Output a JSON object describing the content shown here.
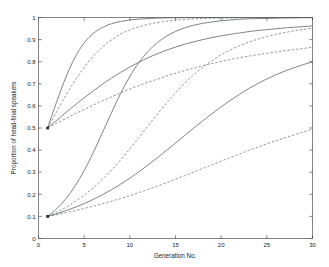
{
  "chart_data": {
    "type": "line",
    "title": "",
    "xlabel": "Generation No.",
    "ylabel": "Proportion of head-final speakers",
    "xlim": [
      0,
      30
    ],
    "ylim": [
      0,
      1
    ],
    "xticks": [
      0,
      5,
      10,
      15,
      20,
      25,
      30
    ],
    "xtick_labels": [
      "0",
      "5",
      "10",
      "15",
      "20",
      "25",
      "30"
    ],
    "yticks": [
      0,
      0.1,
      0.2,
      0.3,
      0.4,
      0.5,
      0.6,
      0.7,
      0.8,
      0.9,
      1
    ],
    "ytick_labels": [
      "0",
      "0.1",
      "0.2",
      "0.3",
      "0.4",
      "0.5",
      "0.6",
      "0.7",
      "0.8",
      "0.9",
      "1"
    ],
    "grid": false,
    "legend": null,
    "x": [
      1,
      2,
      3,
      4,
      5,
      6,
      7,
      8,
      9,
      10,
      11,
      12,
      13,
      14,
      15,
      16,
      17,
      18,
      19,
      20,
      21,
      22,
      23,
      24,
      25,
      26,
      27,
      28,
      29,
      30
    ],
    "series": [
      {
        "name": "start-0.5 fast solid",
        "style": "solid",
        "start": 0.5,
        "values": [
          0.5,
          0.62,
          0.73,
          0.82,
          0.885,
          0.928,
          0.955,
          0.972,
          0.982,
          0.989,
          0.993,
          0.9955,
          0.9972,
          0.9982,
          0.9989,
          0.9993,
          0.9996,
          0.9997,
          0.9998,
          0.9999,
          0.9999,
          1.0,
          1.0,
          1.0,
          1.0,
          1.0,
          1.0,
          1.0,
          1.0,
          1.0
        ]
      },
      {
        "name": "start-0.5 fast dashed",
        "style": "dashed",
        "start": 0.5,
        "values": [
          0.5,
          0.575,
          0.648,
          0.715,
          0.775,
          0.825,
          0.866,
          0.899,
          0.925,
          0.944,
          0.958,
          0.969,
          0.977,
          0.983,
          0.988,
          0.991,
          0.994,
          0.9955,
          0.9967,
          0.9976,
          0.9982,
          0.9987,
          0.999,
          0.9993,
          0.9995,
          0.9996,
          0.9997,
          0.9998,
          0.9998,
          0.9999
        ]
      },
      {
        "name": "start-0.5 medium solid",
        "style": "solid",
        "start": 0.5,
        "values": [
          0.5,
          0.535,
          0.57,
          0.604,
          0.637,
          0.668,
          0.698,
          0.726,
          0.752,
          0.776,
          0.798,
          0.818,
          0.836,
          0.852,
          0.866,
          0.879,
          0.89,
          0.9,
          0.909,
          0.917,
          0.924,
          0.93,
          0.936,
          0.941,
          0.945,
          0.949,
          0.953,
          0.956,
          0.959,
          0.962
        ]
      },
      {
        "name": "start-0.5 slow dashed",
        "style": "dashed",
        "start": 0.5,
        "values": [
          0.5,
          0.522,
          0.543,
          0.564,
          0.584,
          0.604,
          0.623,
          0.641,
          0.659,
          0.676,
          0.692,
          0.707,
          0.721,
          0.735,
          0.748,
          0.76,
          0.771,
          0.782,
          0.792,
          0.801,
          0.81,
          0.818,
          0.825,
          0.832,
          0.838,
          0.844,
          0.85,
          0.855,
          0.86,
          0.865
        ]
      },
      {
        "name": "start-0.1 fast solid",
        "style": "solid",
        "start": 0.1,
        "values": [
          0.1,
          0.135,
          0.18,
          0.237,
          0.307,
          0.389,
          0.479,
          0.57,
          0.657,
          0.733,
          0.797,
          0.847,
          0.886,
          0.915,
          0.937,
          0.953,
          0.965,
          0.974,
          0.98,
          0.985,
          0.989,
          0.992,
          0.994,
          0.995,
          0.996,
          0.997,
          0.998,
          0.998,
          0.999,
          0.999
        ]
      },
      {
        "name": "start-0.1 medium dashed",
        "style": "dashed",
        "start": 0.1,
        "values": [
          0.1,
          0.119,
          0.141,
          0.167,
          0.196,
          0.23,
          0.268,
          0.31,
          0.356,
          0.406,
          0.457,
          0.51,
          0.562,
          0.612,
          0.659,
          0.702,
          0.741,
          0.775,
          0.805,
          0.831,
          0.853,
          0.872,
          0.888,
          0.902,
          0.914,
          0.924,
          0.932,
          0.94,
          0.946,
          0.952
        ]
      },
      {
        "name": "start-0.1 medium solid",
        "style": "solid",
        "start": 0.1,
        "values": [
          0.1,
          0.112,
          0.126,
          0.141,
          0.158,
          0.177,
          0.198,
          0.221,
          0.246,
          0.273,
          0.302,
          0.333,
          0.365,
          0.398,
          0.432,
          0.466,
          0.5,
          0.533,
          0.565,
          0.596,
          0.625,
          0.652,
          0.678,
          0.701,
          0.722,
          0.741,
          0.758,
          0.773,
          0.787,
          0.799
        ]
      },
      {
        "name": "start-0.1 slow dashed",
        "style": "dashed",
        "start": 0.1,
        "values": [
          0.1,
          0.108,
          0.117,
          0.126,
          0.136,
          0.146,
          0.157,
          0.169,
          0.181,
          0.194,
          0.208,
          0.222,
          0.237,
          0.252,
          0.268,
          0.284,
          0.3,
          0.317,
          0.333,
          0.35,
          0.366,
          0.382,
          0.398,
          0.413,
          0.428,
          0.442,
          0.456,
          0.469,
          0.482,
          0.494
        ]
      }
    ]
  }
}
